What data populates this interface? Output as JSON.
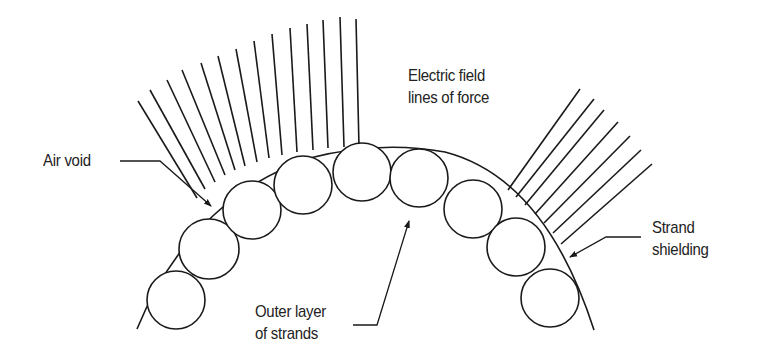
{
  "diagram": {
    "stroke_color": "#1a1a1a",
    "text_color": "#222222",
    "background": "#ffffff",
    "labels": {
      "air_void": {
        "line1": "Air void"
      },
      "electric_field": {
        "line1": "Electric field",
        "line2": "lines of force"
      },
      "outer_layer": {
        "line1": "Outer layer",
        "line2": "of strands"
      },
      "strand_shielding": {
        "line1": "Strand",
        "line2": "shielding"
      }
    },
    "elements": {
      "strands": [
        {
          "cx": 176,
          "cy": 300,
          "r": 29
        },
        {
          "cx": 209,
          "cy": 249,
          "r": 29
        },
        {
          "cx": 252,
          "cy": 210,
          "r": 29
        },
        {
          "cx": 303,
          "cy": 185,
          "r": 29
        },
        {
          "cx": 362,
          "cy": 172,
          "r": 29
        },
        {
          "cx": 419,
          "cy": 176,
          "r": 29
        },
        {
          "cx": 472,
          "cy": 207,
          "r": 29
        },
        {
          "cx": 519,
          "cy": 248,
          "r": 29
        },
        {
          "cx": 550,
          "cy": 298,
          "r": 29
        }
      ],
      "shield_arc": "M 137 329 Q 180 210 300 160 Q 380 138 450 155 Q 530 178 570 265 Q 588 300 594 330",
      "left_field_lines": [
        [
          138,
          101,
          196,
          200
        ],
        [
          150,
          90,
          204,
          190
        ],
        [
          167,
          80,
          214,
          182
        ],
        [
          182,
          70,
          224,
          175
        ],
        [
          201,
          63,
          234,
          170
        ],
        [
          218,
          56,
          244,
          166
        ],
        [
          236,
          49,
          256,
          162
        ],
        [
          254,
          41,
          268,
          158
        ],
        [
          272,
          34,
          281,
          155
        ],
        [
          290,
          28,
          296,
          152
        ],
        [
          307,
          24,
          312,
          150
        ],
        [
          323,
          20,
          327,
          148
        ],
        [
          340,
          17,
          343,
          147
        ],
        [
          356,
          19,
          358,
          147
        ]
      ],
      "right_field_lines": [
        [
          580,
          89,
          508,
          190
        ],
        [
          594,
          99,
          517,
          197
        ],
        [
          604,
          110,
          526,
          205
        ],
        [
          618,
          122,
          536,
          213
        ],
        [
          630,
          136,
          545,
          223
        ],
        [
          641,
          150,
          555,
          232
        ],
        [
          652,
          164,
          563,
          243
        ]
      ]
    }
  }
}
